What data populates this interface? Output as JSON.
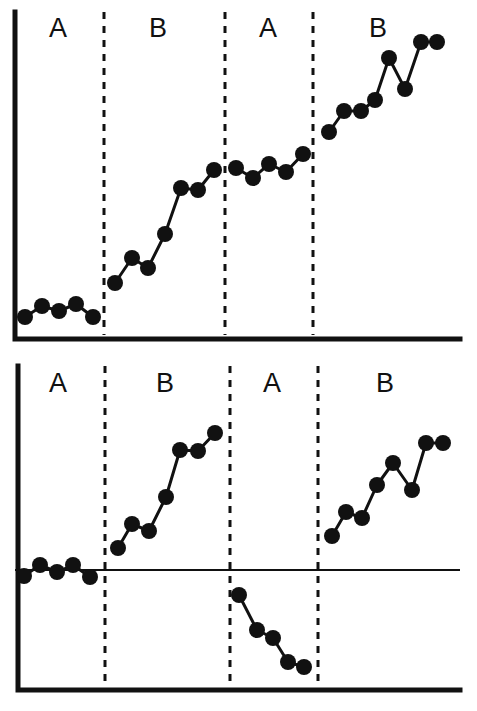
{
  "figure": {
    "background_color": "#ffffff",
    "ink_color": "#111111",
    "width": 477,
    "height": 711
  },
  "panels": [
    {
      "id": "top-panel",
      "name": "upper-graph",
      "has_zero_line": false,
      "origin_x": 15,
      "baseline_y": 339,
      "axis_top_y": 12,
      "axis_right_x": 460,
      "phase_labels": [
        {
          "text": "A",
          "x": 58,
          "y": 30
        },
        {
          "text": "B",
          "x": 158,
          "y": 30
        },
        {
          "text": "A",
          "x": 268,
          "y": 30
        },
        {
          "text": "B",
          "x": 378,
          "y": 30
        }
      ],
      "dividers_x": [
        104,
        225,
        313
      ],
      "divider_y_top": 12,
      "divider_y_bottom": 335,
      "point_radius": 8,
      "segments": [
        {
          "phase": "A",
          "index": 1,
          "points": [
            {
              "x": 25,
              "y": 317
            },
            {
              "x": 42,
              "y": 306
            },
            {
              "x": 59,
              "y": 311
            },
            {
              "x": 76,
              "y": 304
            },
            {
              "x": 93,
              "y": 317
            }
          ]
        },
        {
          "phase": "B",
          "index": 1,
          "points": [
            {
              "x": 115,
              "y": 283
            },
            {
              "x": 132,
              "y": 258
            },
            {
              "x": 148,
              "y": 268
            },
            {
              "x": 165,
              "y": 234
            },
            {
              "x": 181,
              "y": 188
            },
            {
              "x": 198,
              "y": 190
            },
            {
              "x": 214,
              "y": 170
            }
          ]
        },
        {
          "phase": "A",
          "index": 2,
          "points": [
            {
              "x": 236,
              "y": 168
            },
            {
              "x": 253,
              "y": 178
            },
            {
              "x": 269,
              "y": 164
            },
            {
              "x": 286,
              "y": 172
            },
            {
              "x": 303,
              "y": 154
            }
          ]
        },
        {
          "phase": "B",
          "index": 2,
          "points": [
            {
              "x": 329,
              "y": 132
            },
            {
              "x": 344,
              "y": 111
            },
            {
              "x": 361,
              "y": 111
            },
            {
              "x": 375,
              "y": 100
            },
            {
              "x": 389,
              "y": 58
            },
            {
              "x": 405,
              "y": 89
            },
            {
              "x": 421,
              "y": 42
            },
            {
              "x": 437,
              "y": 42
            }
          ]
        }
      ]
    },
    {
      "id": "bottom-panel",
      "name": "lower-graph",
      "has_zero_line": true,
      "origin_x": 18,
      "baseline_y": 690,
      "axis_top_y": 366,
      "axis_right_x": 460,
      "zero_line_y": 570,
      "zero_line_x_start": 15,
      "zero_line_x_end": 460,
      "phase_labels": [
        {
          "text": "A",
          "x": 58,
          "y": 385
        },
        {
          "text": "B",
          "x": 165,
          "y": 385
        },
        {
          "text": "A",
          "x": 272,
          "y": 385
        },
        {
          "text": "B",
          "x": 385,
          "y": 385
        }
      ],
      "dividers_x": [
        105,
        230,
        318
      ],
      "divider_y_top": 366,
      "divider_y_bottom": 688,
      "point_radius": 8,
      "segments": [
        {
          "phase": "A",
          "index": 1,
          "points": [
            {
              "x": 24,
              "y": 576
            },
            {
              "x": 40,
              "y": 565
            },
            {
              "x": 57,
              "y": 572
            },
            {
              "x": 73,
              "y": 565
            },
            {
              "x": 90,
              "y": 577
            }
          ]
        },
        {
          "phase": "B",
          "index": 1,
          "points": [
            {
              "x": 118,
              "y": 548
            },
            {
              "x": 132,
              "y": 524
            },
            {
              "x": 149,
              "y": 531
            },
            {
              "x": 166,
              "y": 497
            },
            {
              "x": 180,
              "y": 450
            },
            {
              "x": 198,
              "y": 451
            },
            {
              "x": 215,
              "y": 433
            }
          ]
        },
        {
          "phase": "A",
          "index": 2,
          "points": [
            {
              "x": 239,
              "y": 595
            },
            {
              "x": 257,
              "y": 630
            },
            {
              "x": 273,
              "y": 638
            },
            {
              "x": 288,
              "y": 662
            },
            {
              "x": 304,
              "y": 667
            }
          ]
        },
        {
          "phase": "B",
          "index": 2,
          "points": [
            {
              "x": 332,
              "y": 536
            },
            {
              "x": 346,
              "y": 512
            },
            {
              "x": 362,
              "y": 518
            },
            {
              "x": 377,
              "y": 485
            },
            {
              "x": 393,
              "y": 463
            },
            {
              "x": 412,
              "y": 490
            },
            {
              "x": 426,
              "y": 443
            },
            {
              "x": 443,
              "y": 443
            }
          ]
        }
      ]
    }
  ],
  "chart_data": [
    {
      "type": "line",
      "name": "upper-graph",
      "title": "",
      "xlabel": "",
      "ylabel": "",
      "grid": false,
      "legend": "none",
      "annotations": [
        "A",
        "B",
        "A",
        "B"
      ],
      "note": "Raw level data; no zero reference line. Values are session numbers (x) vs. response level (y, arbitrary units read from pixel height above the baseline axis).",
      "xlim": [
        0,
        30
      ],
      "ylim": [
        0,
        100
      ],
      "series": [
        {
          "name": "A1",
          "x": [
            1,
            2,
            3,
            4,
            5
          ],
          "values": [
            7,
            10,
            9,
            11,
            7
          ]
        },
        {
          "name": "B1",
          "x": [
            7,
            8,
            9,
            10,
            11,
            12,
            13
          ],
          "values": [
            17,
            25,
            22,
            32,
            46,
            46,
            52
          ]
        },
        {
          "name": "A2",
          "x": [
            15,
            16,
            17,
            18,
            19
          ],
          "values": [
            52,
            49,
            54,
            51,
            57
          ]
        },
        {
          "name": "B2",
          "x": [
            21,
            22,
            23,
            24,
            25,
            26,
            27,
            28
          ],
          "values": [
            63,
            70,
            70,
            73,
            86,
            77,
            91,
            91
          ]
        }
      ]
    },
    {
      "type": "line",
      "name": "lower-graph",
      "title": "",
      "xlabel": "",
      "ylabel": "",
      "grid": false,
      "legend": "none",
      "annotations": [
        "A",
        "B",
        "A",
        "B"
      ],
      "note": "Change-from-baseline data plotted around a zero reference line; the second A phase falls below zero.",
      "xlim": [
        0,
        30
      ],
      "ylim": [
        -40,
        45
      ],
      "zero_reference": 0,
      "series": [
        {
          "name": "A1",
          "x": [
            1,
            2,
            3,
            4,
            5
          ],
          "values": [
            -2,
            2,
            -1,
            2,
            -2
          ]
        },
        {
          "name": "B1",
          "x": [
            7,
            8,
            9,
            10,
            11,
            12,
            13
          ],
          "values": [
            7,
            14,
            12,
            22,
            35,
            34,
            39
          ]
        },
        {
          "name": "A2",
          "x": [
            15,
            16,
            17,
            18,
            19
          ],
          "values": [
            -8,
            -19,
            -21,
            -28,
            -30
          ]
        },
        {
          "name": "B2",
          "x": [
            21,
            22,
            23,
            24,
            25,
            26,
            27,
            28
          ],
          "values": [
            10,
            17,
            15,
            25,
            32,
            24,
            38,
            38
          ]
        }
      ]
    }
  ]
}
